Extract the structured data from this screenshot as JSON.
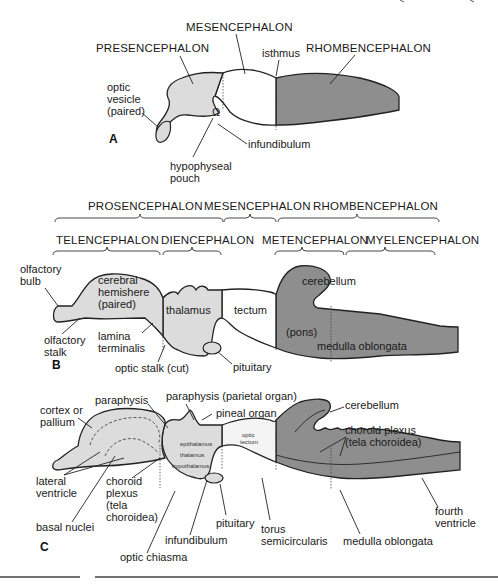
{
  "colors": {
    "light_fill": "#dcdcdc",
    "white_fill": "#ffffff",
    "dark_fill": "#8e8e8e",
    "mid_fill": "#cfcfcf",
    "line": "#222222"
  },
  "panel_a": {
    "letter": "A",
    "labels": {
      "mesencephalon": "MESENCEPHALON",
      "presencephalon": "PRESENCEPHALON",
      "isthmus": "isthmus",
      "rhombencephalon": "RHOMBENCEPHALON",
      "optic_vesicle_1": "optic",
      "optic_vesicle_2": "vesicle",
      "optic_vesicle_3": "(paired)",
      "infundibulum": "infundibulum",
      "hypophyseal_1": "hypophyseal",
      "hypophyseal_2": "pouch"
    }
  },
  "panel_b": {
    "letter": "B",
    "upper_divisions": [
      "PROSENCEPHALON",
      "MESENCEPHALON",
      "RHOMBENCEPHALON"
    ],
    "lower_divisions": [
      "TELENCEPHALON",
      "DIENCEPHALON",
      "METENCEPHALON",
      "MYELENCEPHALON"
    ],
    "labels": {
      "olfactory_bulb_1": "olfactory",
      "olfactory_bulb_2": "bulb",
      "cerebral_1": "cerebral",
      "cerebral_2": "hemishere",
      "cerebral_3": "(paired)",
      "thalamus": "thalamus",
      "tectum": "tectum",
      "cerebellum": "cerebellum",
      "pons": "(pons)",
      "medulla": "medulla oblongata",
      "olfactory_stalk_1": "olfactory",
      "olfactory_stalk_2": "stalk",
      "lamina_1": "lamina",
      "lamina_2": "terminalis",
      "optic_stalk": "optic stalk (cut)",
      "pituitary": "pituitary"
    }
  },
  "panel_c": {
    "letter": "C",
    "labels": {
      "cortex_1": "cortex or",
      "cortex_2": "pallium",
      "paraphysis": "paraphysis",
      "paraphysis_parietal": "paraphysis (parietal organ)",
      "pineal": "pineal organ",
      "cerebellum": "cerebellum",
      "choroid_r_1": "choroid plexus",
      "choroid_r_2": "(tela choroidea)",
      "epithalamus": "epithalamus",
      "thalamus": "thalamus",
      "hypothalamus": "hypothalamus",
      "optic_tectum_1": "optic",
      "optic_tectum_2": "tectum",
      "lateral_1": "lateral",
      "lateral_2": "ventricle",
      "choroid_l_1": "choroid",
      "choroid_l_2": "plexus",
      "choroid_l_3": "(tela",
      "choroid_l_4": "choroidea)",
      "basal": "basal nuclei",
      "pituitary": "pituitary",
      "infundibulum": "infundibulum",
      "torus_1": "torus",
      "torus_2": "semicircularis",
      "medulla": "medulla oblongata",
      "fourth_1": "fourth",
      "fourth_2": "ventricle",
      "optic_chiasma": "optic chiasma"
    }
  }
}
